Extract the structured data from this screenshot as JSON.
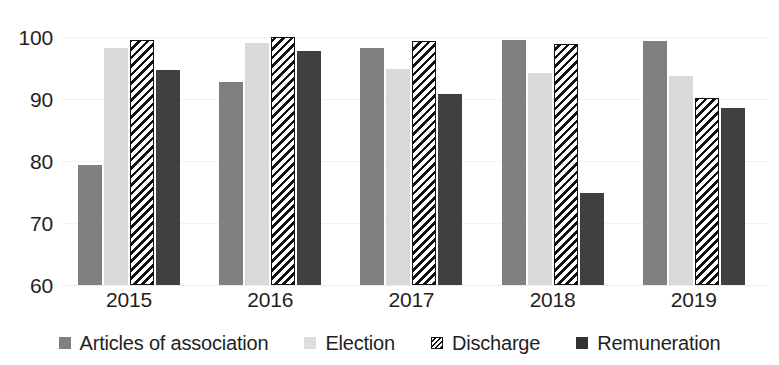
{
  "chart_data": {
    "type": "bar",
    "title": "",
    "subtitle": "",
    "xlabel": "",
    "ylabel": "",
    "categories": [
      "2015",
      "2016",
      "2017",
      "2018",
      "2019"
    ],
    "ylim": [
      60,
      100
    ],
    "yticks": [
      60,
      70,
      80,
      90,
      100
    ],
    "ytick_labels": [
      "60",
      "70",
      "80",
      "90",
      "100"
    ],
    "grid": true,
    "legend_position": "bottom",
    "series": [
      {
        "name": "Articles of association",
        "color": "#808080",
        "pattern": "solid",
        "values": [
          79.3,
          92.7,
          98.3,
          99.5,
          99.4
        ]
      },
      {
        "name": "Election",
        "color": "#d9d9d9",
        "pattern": "solid",
        "values": [
          98.2,
          99.0,
          94.8,
          94.2,
          93.7
        ]
      },
      {
        "name": "Discharge",
        "color": "#ffffff",
        "pattern": "diagonal-hatch",
        "values": [
          99.5,
          100.0,
          99.4,
          98.8,
          90.2
        ]
      },
      {
        "name": "Remuneration",
        "color": "#404040",
        "pattern": "solid",
        "values": [
          94.6,
          97.7,
          90.8,
          74.8,
          88.6
        ]
      }
    ]
  },
  "legend": {
    "items": [
      {
        "label": "Articles of association",
        "swatch": "legend-swatch-articles"
      },
      {
        "label": "Election",
        "swatch": "legend-swatch-election"
      },
      {
        "label": "Discharge",
        "swatch": "legend-swatch-discharge"
      },
      {
        "label": "Remuneration",
        "swatch": "legend-swatch-remuneration"
      }
    ]
  }
}
